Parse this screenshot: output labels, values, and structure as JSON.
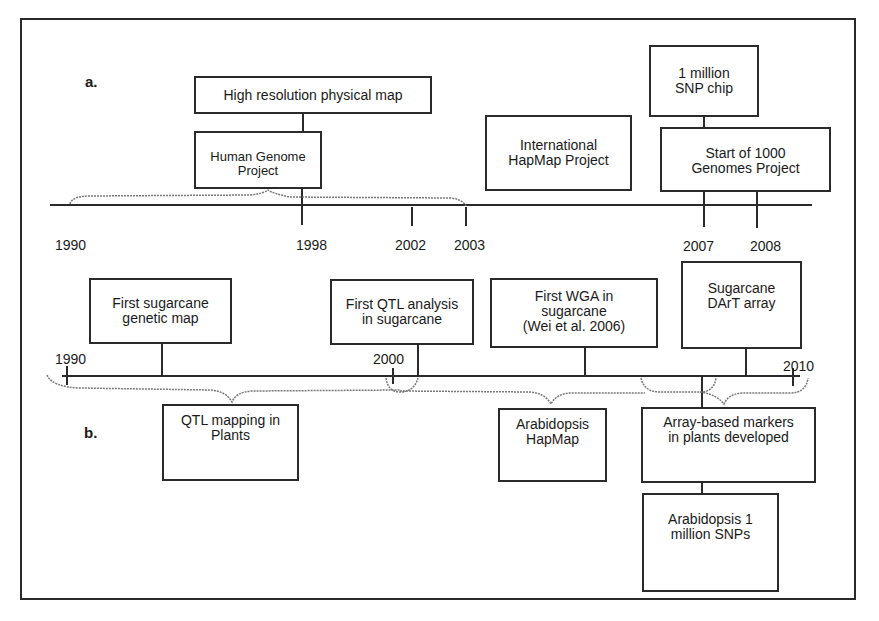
{
  "panel_a": {
    "label": "a.",
    "years": [
      "1990",
      "1998",
      "2002",
      "2003",
      "2007",
      "2008"
    ],
    "events": [
      {
        "text": "High resolution physical map"
      },
      {
        "text": "Human Genome\nProject"
      },
      {
        "text": "International\nHapMap Project"
      },
      {
        "text": "1 million\nSNP chip"
      },
      {
        "text": "Start of 1000\nGenomes Project"
      }
    ]
  },
  "panel_b": {
    "label": "b.",
    "years": [
      "1990",
      "2000",
      "2010"
    ],
    "events_above": [
      {
        "text": "First sugarcane\ngenetic map"
      },
      {
        "text": "First QTL analysis\nin sugarcane"
      },
      {
        "text": "First WGA in\nsugarcane\n(Wei et al. 2006)"
      },
      {
        "text": "Sugarcane\nDArT array"
      }
    ],
    "events_below": [
      {
        "text": "QTL mapping in\nPlants"
      },
      {
        "text": "Arabidopsis\nHapMap"
      },
      {
        "text": "Array-based markers\nin plants developed"
      },
      {
        "text": "Arabidopsis 1\nmillion SNPs"
      }
    ]
  },
  "colors": {
    "line": "#2a2a2a",
    "dotted": "#777777",
    "background": "#ffffff"
  }
}
